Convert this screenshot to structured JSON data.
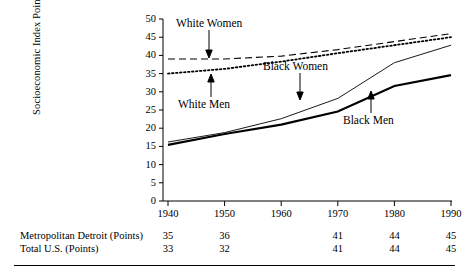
{
  "chart_data": {
    "type": "line",
    "title": "",
    "xlabel": "",
    "ylabel": "Socioeconomic Index Points",
    "x": [
      1940,
      1950,
      1960,
      1970,
      1980,
      1990
    ],
    "xlim": [
      1940,
      1990
    ],
    "ylim": [
      0,
      50
    ],
    "ytick_step": 5,
    "grid": false,
    "legend_position": "inline-annotations",
    "yticks": [
      "50",
      "45",
      "40",
      "35",
      "30",
      "25",
      "20",
      "15",
      "10",
      "5",
      "0"
    ],
    "xticks": [
      "1940",
      "1950",
      "1960",
      "1970",
      "1980",
      "1990"
    ],
    "series": [
      {
        "name": "White Women",
        "style": "long-dashed",
        "values": [
          39.0,
          39.0,
          39.8,
          41.6,
          43.8,
          46.0
        ]
      },
      {
        "name": "White Men",
        "style": "dotted",
        "values": [
          35.0,
          36.3,
          38.3,
          40.6,
          42.8,
          45.0
        ]
      },
      {
        "name": "Black Women",
        "style": "thin-solid",
        "values": [
          16.2,
          18.8,
          22.6,
          28.2,
          38.0,
          42.8
        ]
      },
      {
        "name": "Black Men",
        "style": "thick-solid",
        "values": [
          15.4,
          18.4,
          21.0,
          24.6,
          31.6,
          34.6
        ]
      }
    ],
    "annotations": [
      {
        "text": "White Women",
        "arrow": "down",
        "target_series": "White Women"
      },
      {
        "text": "White Men",
        "arrow": "up",
        "target_series": "White Men"
      },
      {
        "text": "Black Women",
        "arrow": "down",
        "target_series": "Black Women"
      },
      {
        "text": "Black Men",
        "arrow": "up",
        "target_series": "Black Men"
      }
    ]
  },
  "table": {
    "columns": [
      "1940",
      "1950",
      "1960",
      "1970",
      "1980",
      "1990"
    ],
    "rows": [
      {
        "label": "Metropolitan Detroit (Points)",
        "values": [
          "35",
          "36",
          "",
          "41",
          "44",
          "45"
        ]
      },
      {
        "label": "Total U.S. (Points)",
        "values": [
          "33",
          "32",
          "",
          "41",
          "44",
          "45"
        ]
      }
    ]
  }
}
